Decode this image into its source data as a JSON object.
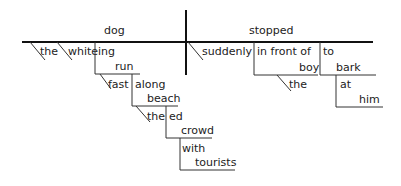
{
  "diagram": {
    "type": "sentence-diagram",
    "colors": {
      "line": "#111111",
      "text": "#222222",
      "background": "#ffffff"
    },
    "subject": {
      "word": "dog",
      "modifiers": [
        "the",
        "white"
      ],
      "participle_phrase": {
        "suffix": "ing",
        "verb": "run",
        "adverb": "fast",
        "preposition": "along",
        "object": "beach",
        "object_modifier": "the",
        "participle2_suffix": "ed",
        "participle2_verb": "crowd",
        "preposition2": "with",
        "object2": "tourists"
      }
    },
    "predicate": {
      "verb": "stopped",
      "adverb": "suddenly",
      "prep_phrase": {
        "preposition": "in front of",
        "object": "boy",
        "object_modifier": "the"
      },
      "infinitive": {
        "marker": "to",
        "verb": "bark",
        "preposition": "at",
        "object": "him"
      }
    }
  }
}
